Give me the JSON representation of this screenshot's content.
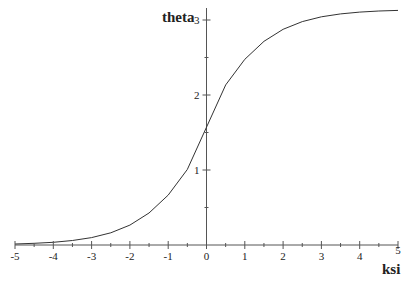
{
  "chart_data": {
    "type": "line",
    "title": "",
    "xlabel": "ksi",
    "ylabel": "theta",
    "xlim": [
      -5,
      5
    ],
    "ylim": [
      0,
      3.14
    ],
    "grid": false,
    "legend": null,
    "x_ticks": [
      "-5",
      "-4",
      "-3",
      "-2",
      "-1",
      "0",
      "1",
      "2",
      "3",
      "4",
      "5"
    ],
    "y_ticks": [
      "1",
      "2",
      "3"
    ],
    "series": [
      {
        "name": "theta",
        "x": [
          -5,
          -4.5,
          -4,
          -3.5,
          -3,
          -2.5,
          -2,
          -1.5,
          -1,
          -0.5,
          0,
          0.5,
          1,
          1.5,
          2,
          2.5,
          3,
          3.5,
          4,
          4.5,
          5
        ],
        "values": [
          0.0135,
          0.0222,
          0.0366,
          0.0603,
          0.0993,
          0.1631,
          0.2658,
          0.4262,
          0.6658,
          1.0068,
          1.5708,
          2.1348,
          2.4758,
          2.7154,
          2.8758,
          2.9785,
          3.0423,
          3.0813,
          3.105,
          3.1194,
          3.1281
        ]
      }
    ]
  },
  "axes": {
    "x_title": "ksi",
    "y_title": "theta"
  },
  "style": {
    "axis_color": "#555555",
    "curve_color": "#333333"
  }
}
